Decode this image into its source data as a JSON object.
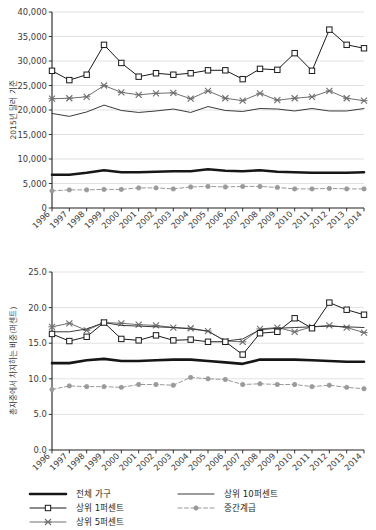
{
  "figure": {
    "panels": [
      "top-chart",
      "bottom-chart"
    ],
    "legend_title": ""
  },
  "colors": {
    "total_households": "#161616",
    "top10": "#3a3a3a",
    "top1": "#1a1a1a",
    "top5": "#6f6f6f",
    "middle_class": "#9a9a9a",
    "grid": "#d9d9d9",
    "axis": "#231f20",
    "background": "#ffffff"
  },
  "legend": {
    "items": [
      {
        "label": "전체 가구",
        "key": "total_households",
        "style": "thick-solid",
        "marker": "none"
      },
      {
        "label": "상위 10퍼센트",
        "key": "top10",
        "style": "solid",
        "marker": "none"
      },
      {
        "label": "상위 1퍼센트",
        "key": "top1",
        "style": "solid",
        "marker": "square"
      },
      {
        "label": "중간계급",
        "key": "middle_class",
        "style": "dashed",
        "marker": "circle"
      },
      {
        "label": "상위 5퍼센트",
        "key": "top5",
        "style": "solid",
        "marker": "x"
      }
    ]
  },
  "chart_data": [
    {
      "id": "top-chart",
      "type": "line",
      "title": "",
      "xlabel": "",
      "ylabel": "2015년 달러 기준",
      "grid": true,
      "legend_position": "below-figure",
      "x": [
        1996,
        1997,
        1998,
        1999,
        2000,
        2001,
        2002,
        2003,
        2004,
        2005,
        2006,
        2007,
        2008,
        2009,
        2010,
        2011,
        2012,
        2013,
        2014
      ],
      "xlim": [
        1996,
        2014
      ],
      "ylim": [
        0,
        40000
      ],
      "yticks": [
        0,
        5000,
        10000,
        15000,
        20000,
        25000,
        30000,
        35000,
        40000
      ],
      "ytick_labels": [
        "0",
        "5,000",
        "10,000",
        "15,000",
        "20,000",
        "25,000",
        "30,000",
        "35,000",
        "40,000"
      ],
      "xtick_labels": [
        "1996",
        "1997",
        "1998",
        "1999",
        "2000",
        "2001",
        "2002",
        "2003",
        "2004",
        "2005",
        "2006",
        "2007",
        "2008",
        "2009",
        "2010",
        "2011",
        "2012",
        "2013",
        "2014"
      ],
      "series": [
        {
          "name": "상위 1퍼센트",
          "key": "top1",
          "marker": "square",
          "style": "solid",
          "values": [
            28000,
            26100,
            27200,
            33300,
            29600,
            26800,
            27500,
            27200,
            27500,
            28100,
            28100,
            26300,
            28400,
            28200,
            31600,
            28000,
            36400,
            33300,
            32600
          ]
        },
        {
          "name": "상위 5퍼센트",
          "key": "top5",
          "marker": "x",
          "style": "solid",
          "values": [
            22300,
            22400,
            22700,
            25000,
            23600,
            23100,
            23400,
            23500,
            22300,
            23900,
            22400,
            21900,
            23400,
            22000,
            22400,
            22700,
            23900,
            22400,
            21900
          ]
        },
        {
          "name": "상위 10퍼센트",
          "key": "top10",
          "marker": "none",
          "style": "solid",
          "values": [
            19300,
            18700,
            19600,
            21000,
            19900,
            19500,
            19800,
            20200,
            19500,
            20700,
            19900,
            19700,
            20300,
            20200,
            19800,
            20300,
            19800,
            19800,
            20300
          ]
        },
        {
          "name": "전체 가구",
          "key": "total_households",
          "marker": "none",
          "style": "thick-solid",
          "values": [
            6800,
            6800,
            7200,
            7700,
            7300,
            7300,
            7400,
            7500,
            7500,
            7900,
            7600,
            7500,
            7700,
            7400,
            7300,
            7200,
            7200,
            7200,
            7300
          ]
        },
        {
          "name": "중간계급",
          "key": "middle_class",
          "marker": "circle",
          "style": "dashed",
          "values": [
            3500,
            3700,
            3700,
            3800,
            3800,
            4100,
            4100,
            3900,
            4300,
            4400,
            4300,
            4400,
            4400,
            4200,
            3900,
            3900,
            4000,
            3900,
            3900
          ]
        }
      ]
    },
    {
      "id": "bottom-chart",
      "type": "line",
      "title": "",
      "xlabel": "",
      "ylabel": "총자중에서 차지하는 비중(퍼센트)",
      "grid": true,
      "legend_position": "below-figure",
      "x": [
        1996,
        1997,
        1998,
        1999,
        2000,
        2001,
        2002,
        2003,
        2004,
        2005,
        2006,
        2007,
        2008,
        2009,
        2010,
        2011,
        2012,
        2013,
        2014
      ],
      "xlim": [
        1996,
        2014
      ],
      "ylim": [
        0,
        25
      ],
      "yticks": [
        0,
        5,
        10,
        15,
        20,
        25
      ],
      "ytick_labels": [
        "0.0",
        "5.0",
        "10.0",
        "15.0",
        "20.0",
        "25.0"
      ],
      "xtick_labels": [
        "1996",
        "1997",
        "1998",
        "1999",
        "2000",
        "2001",
        "2002",
        "2003",
        "2004",
        "2005",
        "2006",
        "2007",
        "2008",
        "2009",
        "2010",
        "2011",
        "2012",
        "2013",
        "2014"
      ],
      "series": [
        {
          "name": "상위 1퍼센트",
          "key": "top1",
          "marker": "square",
          "style": "solid",
          "values": [
            16.3,
            15.3,
            15.9,
            17.9,
            15.6,
            15.4,
            16.1,
            15.4,
            15.5,
            15.2,
            15.2,
            13.4,
            16.4,
            16.6,
            18.5,
            17.1,
            20.7,
            19.7,
            19.0
          ]
        },
        {
          "name": "상위 5퍼센트",
          "key": "top5",
          "marker": "x",
          "style": "solid",
          "values": [
            17.3,
            17.8,
            16.8,
            17.9,
            17.8,
            17.6,
            17.5,
            17.2,
            17.1,
            16.7,
            15.3,
            15.2,
            17.0,
            17.2,
            16.6,
            17.3,
            17.5,
            17.2,
            16.5
          ]
        },
        {
          "name": "상위 10퍼센트",
          "key": "top10",
          "marker": "none",
          "style": "solid",
          "values": [
            16.6,
            16.6,
            17.0,
            17.9,
            17.5,
            17.4,
            17.3,
            17.2,
            17.0,
            16.7,
            15.3,
            15.6,
            16.9,
            17.1,
            17.2,
            17.3,
            17.4,
            17.3,
            17.2
          ]
        },
        {
          "name": "전체 가구",
          "key": "total_households",
          "marker": "none",
          "style": "thick-solid",
          "values": [
            12.2,
            12.2,
            12.6,
            12.8,
            12.5,
            12.5,
            12.6,
            12.7,
            12.7,
            12.5,
            12.3,
            12.1,
            12.7,
            12.7,
            12.7,
            12.6,
            12.5,
            12.4,
            12.4
          ]
        },
        {
          "name": "중간계급",
          "key": "middle_class",
          "marker": "circle",
          "style": "dashed",
          "values": [
            8.5,
            9.0,
            8.9,
            8.9,
            8.8,
            9.2,
            9.2,
            9.1,
            10.2,
            10.0,
            9.9,
            9.2,
            9.3,
            9.2,
            9.2,
            8.9,
            9.1,
            8.8,
            8.6
          ]
        }
      ]
    }
  ]
}
